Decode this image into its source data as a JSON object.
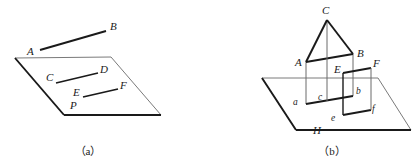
{
  "figure": {
    "type": "geometry-diagram-pair",
    "background_color": "#ffffff",
    "ink_color": "#1a1a1a",
    "thin_line_color": "#6b6b6b",
    "panels": [
      {
        "id": "panel-a",
        "caption": "（a）",
        "description": "A plane (parallelogram) with line AB above it and lines CD, EF drawn inside it, point P on the plane",
        "labels": {
          "A": "A",
          "B": "B",
          "C": "C",
          "D": "D",
          "E": "E",
          "F": "F",
          "P": "P"
        }
      },
      {
        "id": "panel-b",
        "caption": "（b）",
        "description": "Horizontal plane H with vertical planes: triangle ABC over quadrilateral ABba, and rectangle EFfe, with foot points a, b, c, e, f",
        "labels": {
          "A": "A",
          "B": "B",
          "C": "C",
          "E": "E",
          "F": "F",
          "H": "H",
          "a": "a",
          "b": "b",
          "c": "c",
          "e": "e",
          "f": "f"
        }
      }
    ],
    "geometry": {
      "panel_a": {
        "plane_polygon": [
          [
            15,
            58
          ],
          [
            111,
            57
          ],
          [
            161,
            115
          ],
          [
            64,
            115
          ]
        ],
        "segment_AB": [
          [
            40,
            50
          ],
          [
            106,
            31
          ]
        ],
        "segment_CD": [
          [
            56,
            83
          ],
          [
            98,
            73
          ]
        ],
        "segment_EF": [
          [
            83,
            97
          ],
          [
            118,
            89
          ]
        ],
        "label_positions": {
          "A": [
            27,
            55
          ],
          "B": [
            110,
            30
          ],
          "C": [
            48,
            80
          ],
          "D": [
            101,
            73
          ],
          "E": [
            76,
            95
          ],
          "F": [
            121,
            88
          ],
          "P": [
            72,
            107
          ]
        },
        "caption_position": [
          88,
          154
        ]
      },
      "panel_b": {
        "plane_polygon": [
          [
            262,
            78
          ],
          [
            378,
            78
          ],
          [
            411,
            130
          ],
          [
            296,
            130
          ]
        ],
        "triangle_ABC": [
          [
            306,
            62
          ],
          [
            327,
            20
          ],
          [
            353,
            54
          ]
        ],
        "quad_ABba": [
          [
            306,
            62
          ],
          [
            353,
            54
          ],
          [
            353,
            96
          ],
          [
            306,
            104
          ]
        ],
        "rect_EFfe": [
          [
            343,
            73
          ],
          [
            371,
            68
          ],
          [
            371,
            110
          ],
          [
            343,
            115
          ]
        ],
        "vertical_Cc": [
          [
            327,
            20
          ],
          [
            327,
            101
          ]
        ],
        "label_positions": {
          "C": [
            323,
            13
          ],
          "A": [
            297,
            64
          ],
          "B": [
            357,
            54
          ],
          "E": [
            337,
            72
          ],
          "F": [
            372,
            65
          ],
          "b": [
            357,
            93
          ],
          "c": [
            321,
            99
          ],
          "a": [
            294,
            103
          ],
          "e": [
            331,
            119
          ],
          "f": [
            371,
            110
          ],
          "H": [
            315,
            131
          ]
        },
        "caption_position": [
          332,
          154
        ]
      }
    }
  }
}
